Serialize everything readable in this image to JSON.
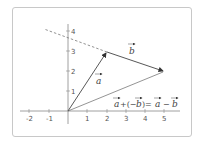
{
  "diagram": {
    "type": "vector-subtraction",
    "axes": {
      "x_ticks": [
        "-2",
        "-1",
        "1",
        "2",
        "3",
        "4",
        "5"
      ],
      "y_ticks": [
        "1",
        "2",
        "3",
        "4"
      ]
    },
    "vectors": [
      {
        "name": "a",
        "label": "a",
        "from": [
          0,
          0
        ],
        "to": [
          2,
          3
        ]
      },
      {
        "name": "minus-b",
        "label": "b",
        "from": [
          2,
          3
        ],
        "to": [
          5,
          2
        ]
      },
      {
        "name": "a-minus-b",
        "from": [
          0,
          0
        ],
        "to": [
          5,
          2
        ]
      }
    ],
    "dashed_line": {
      "from": [
        2,
        3
      ],
      "to": [
        -1.7,
        4.2
      ]
    },
    "equation": {
      "part1": "a",
      "part2": "+(−",
      "part3": "b",
      "part4": ")=",
      "part5": "a",
      "part6": "−",
      "part7": "b"
    },
    "colors": {
      "axis": "#888888",
      "vector": "#444444",
      "dashed": "#777777",
      "frame": "#c8c8c8"
    }
  }
}
